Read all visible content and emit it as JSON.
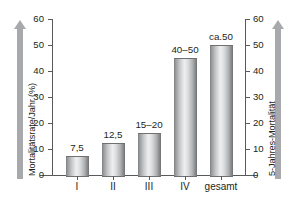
{
  "chart_data": {
    "type": "bar",
    "title": "",
    "categories": [
      "I",
      "II",
      "III",
      "IV",
      "gesamt"
    ],
    "values": [
      7.5,
      12.5,
      16,
      45,
      50
    ],
    "data_labels": [
      "7,5",
      "12,5",
      "15–20",
      "40–50",
      "ca.50"
    ],
    "ylabel": "Mortalitätsrate/Jahr (%)",
    "ylabel_right": "5-Jahres-Mortalität",
    "xlabel": "",
    "ylim": [
      0,
      60
    ],
    "yticks": [
      0,
      10,
      20,
      30,
      40,
      50,
      60
    ],
    "ytick_labels": [
      "0",
      "10",
      "20",
      "30",
      "40",
      "50",
      "60"
    ],
    "ylim_right": [
      0,
      60
    ],
    "yticks_right": [
      0,
      10,
      20,
      30,
      40,
      50,
      60
    ],
    "ytick_labels_right": [
      "0",
      "10",
      "20",
      "30",
      "40",
      "50",
      "60"
    ],
    "grid": false,
    "legend": false,
    "bar_color": "#c8c9ca",
    "axis_color": "#58595b",
    "arrow_color": "#a7a9ac",
    "background": "#ffffff"
  },
  "axes": {
    "left_arrow_name": "up-arrow-icon",
    "right_arrow_name": "up-arrow-icon"
  }
}
